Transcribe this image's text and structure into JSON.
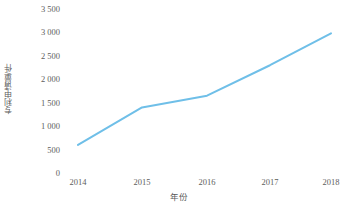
{
  "chart_data": {
    "type": "line",
    "title": "",
    "subtitle": "",
    "xlabel": "年份",
    "ylabel": "专利申请量/件",
    "categories": [
      "2014",
      "2015",
      "2016",
      "2017",
      "2018"
    ],
    "values": [
      600,
      1400,
      1650,
      2300,
      2980
    ],
    "series": [
      {
        "name": "专利申请量",
        "values": [
          600,
          1400,
          1650,
          2300,
          2980
        ],
        "color": "#6FBFE8"
      }
    ],
    "ylim": [
      0,
      3500
    ],
    "ytick_values": [
      0,
      500,
      1000,
      1500,
      2000,
      2500,
      3000,
      3500
    ],
    "ytick_labels": [
      "0",
      "500",
      "1 000",
      "1 500",
      "2 000",
      "2 500",
      "3 000",
      "3 500"
    ],
    "xtick_labels": [
      "2014",
      "2015",
      "2016",
      "2017",
      "2018"
    ],
    "grid": false,
    "legend": false,
    "legend_position": "none",
    "markers": false,
    "line_width_px": 2,
    "annotations": []
  },
  "style": {
    "line_color": "#6FBFE8",
    "text_color": "#5d5d5d",
    "background": "#ffffff"
  }
}
